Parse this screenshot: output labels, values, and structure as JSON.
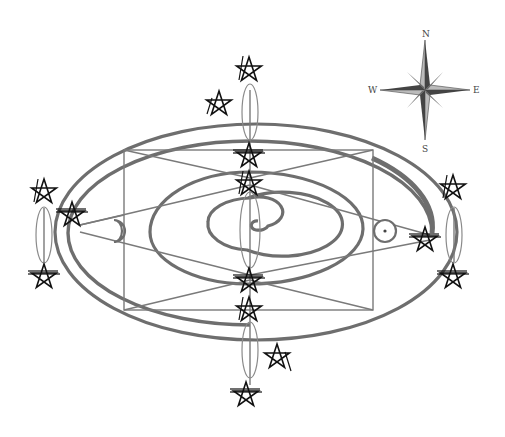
{
  "diagram": {
    "type": "geomantic / cosmological orbit diagram",
    "background": "#ffffff",
    "line_color": "#6e6e6e",
    "symbol_color": "#111111",
    "compass": {
      "labels": {
        "north": "N",
        "south": "S",
        "east": "E",
        "west": "W"
      },
      "center": [
        425,
        90
      ]
    },
    "center_symbol": "spiral",
    "left_symbol": "crescent-moon",
    "right_symbol": "sun-circled-dot",
    "pentagram_count": 14,
    "stations": [
      "top",
      "left",
      "right",
      "bottom",
      "center-upper",
      "center-lower"
    ]
  }
}
